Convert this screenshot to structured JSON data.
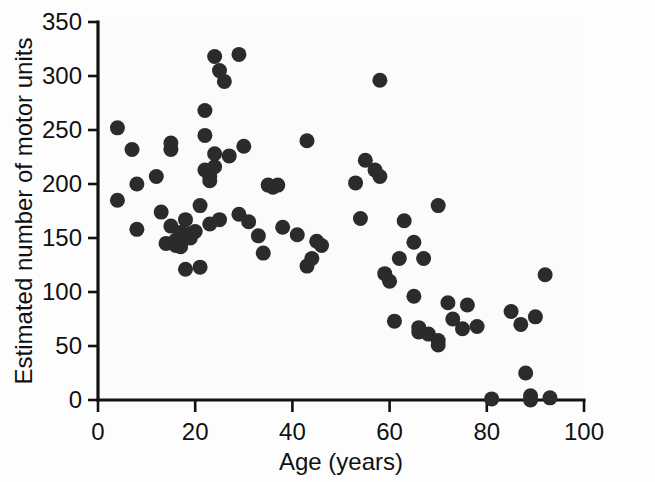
{
  "chart_data": {
    "type": "scatter",
    "title": "",
    "xlabel": "Age (years)",
    "ylabel": "Estimated number of motor units",
    "xlim": [
      0,
      100
    ],
    "ylim": [
      0,
      350
    ],
    "xticks": [
      0,
      20,
      40,
      60,
      80,
      100
    ],
    "yticks": [
      0,
      50,
      100,
      150,
      200,
      250,
      300,
      350
    ],
    "xticklabels": [
      "0",
      "20",
      "40",
      "60",
      "80",
      "100"
    ],
    "yticklabels": [
      "0",
      "50",
      "100",
      "150",
      "200",
      "250",
      "300",
      "350"
    ],
    "grid": false,
    "legend": null,
    "marker": {
      "shape": "circle",
      "color": "#2b2b2b",
      "size": 9
    },
    "series": [
      {
        "name": "Subjects",
        "points": [
          [
            4,
            252
          ],
          [
            4,
            185
          ],
          [
            7,
            232
          ],
          [
            8,
            200
          ],
          [
            8,
            158
          ],
          [
            12,
            207
          ],
          [
            13,
            174
          ],
          [
            14,
            145
          ],
          [
            15,
            232
          ],
          [
            15,
            238
          ],
          [
            15,
            161
          ],
          [
            16,
            143
          ],
          [
            16,
            148
          ],
          [
            17,
            142
          ],
          [
            17,
            155
          ],
          [
            18,
            167
          ],
          [
            18,
            121
          ],
          [
            19,
            154
          ],
          [
            19,
            150
          ],
          [
            20,
            156
          ],
          [
            21,
            180
          ],
          [
            21,
            123
          ],
          [
            22,
            268
          ],
          [
            22,
            245
          ],
          [
            22,
            213
          ],
          [
            23,
            207
          ],
          [
            23,
            203
          ],
          [
            23,
            163
          ],
          [
            24,
            318
          ],
          [
            24,
            228
          ],
          [
            24,
            216
          ],
          [
            25,
            305
          ],
          [
            25,
            167
          ],
          [
            26,
            295
          ],
          [
            27,
            226
          ],
          [
            29,
            320
          ],
          [
            29,
            172
          ],
          [
            30,
            235
          ],
          [
            31,
            165
          ],
          [
            33,
            152
          ],
          [
            34,
            136
          ],
          [
            35,
            199
          ],
          [
            36,
            197
          ],
          [
            37,
            199
          ],
          [
            38,
            160
          ],
          [
            41,
            153
          ],
          [
            43,
            240
          ],
          [
            43,
            124
          ],
          [
            44,
            131
          ],
          [
            45,
            147
          ],
          [
            46,
            143
          ],
          [
            53,
            201
          ],
          [
            54,
            168
          ],
          [
            55,
            222
          ],
          [
            57,
            213
          ],
          [
            58,
            207
          ],
          [
            58,
            296
          ],
          [
            59,
            117
          ],
          [
            60,
            110
          ],
          [
            61,
            73
          ],
          [
            62,
            131
          ],
          [
            63,
            166
          ],
          [
            65,
            146
          ],
          [
            65,
            96
          ],
          [
            66,
            63
          ],
          [
            66,
            67
          ],
          [
            67,
            131
          ],
          [
            68,
            61
          ],
          [
            70,
            180
          ],
          [
            70,
            55
          ],
          [
            70,
            51
          ],
          [
            72,
            90
          ],
          [
            73,
            75
          ],
          [
            75,
            66
          ],
          [
            76,
            88
          ],
          [
            78,
            68
          ],
          [
            81,
            1
          ],
          [
            85,
            82
          ],
          [
            87,
            70
          ],
          [
            88,
            25
          ],
          [
            89,
            4
          ],
          [
            89,
            0
          ],
          [
            90,
            77
          ],
          [
            92,
            116
          ],
          [
            93,
            2
          ]
        ]
      }
    ],
    "n_points": 85
  },
  "figure": {
    "background_color": "#fdfdfd",
    "axis_color": "#121212",
    "text_color": "#111111"
  }
}
